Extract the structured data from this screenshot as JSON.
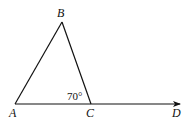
{
  "diagram": {
    "type": "geometry",
    "points": {
      "A": {
        "label": "A",
        "x": 15,
        "y": 104
      },
      "B": {
        "label": "B",
        "x": 62,
        "y": 22
      },
      "C": {
        "label": "C",
        "x": 91,
        "y": 104
      },
      "D": {
        "label": "D",
        "x": 180,
        "y": 104
      }
    },
    "segments": [
      {
        "from": "A",
        "to": "B"
      },
      {
        "from": "B",
        "to": "C"
      },
      {
        "from": "A",
        "to": "D",
        "arrow": "end"
      }
    ],
    "angle_annotation": {
      "text": "70°",
      "vertex": "C",
      "between": [
        "B",
        "A"
      ]
    },
    "colors": {
      "stroke": "#111111",
      "background": "#ffffff"
    }
  }
}
